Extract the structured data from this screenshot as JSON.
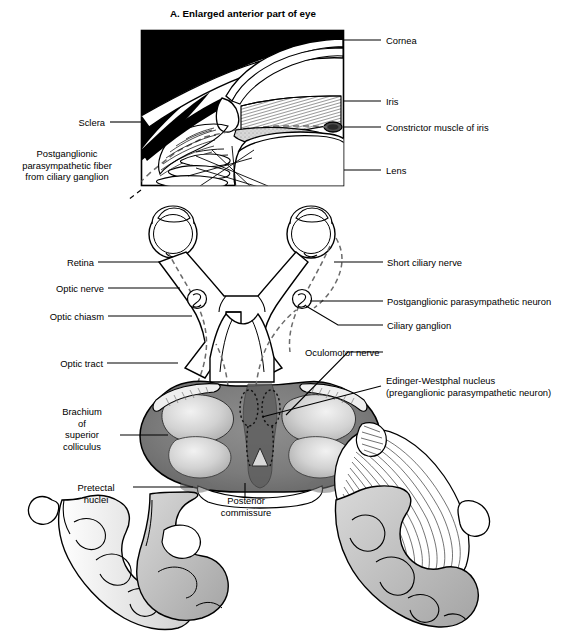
{
  "figure": {
    "panel_a": {
      "title": "A. Enlarged anterior part of eye",
      "labels_right": [
        {
          "id": "cornea",
          "text": "Cornea"
        },
        {
          "id": "iris",
          "text": "Iris"
        },
        {
          "id": "constrictor-muscle-of-iris",
          "text": "Constrictor muscle of iris"
        },
        {
          "id": "lens",
          "text": "Lens"
        }
      ],
      "labels_left": [
        {
          "id": "sclera",
          "text": "Sclera"
        },
        {
          "id": "postganglionic-parasympathetic-fiber",
          "text": "Postganglionic\nparasympathetic fiber\nfrom ciliary ganglion"
        }
      ]
    },
    "panel_b": {
      "labels_left": [
        {
          "id": "retina",
          "text": "Retina"
        },
        {
          "id": "optic-nerve",
          "text": "Optic nerve"
        },
        {
          "id": "optic-chiasm",
          "text": "Optic chiasm"
        },
        {
          "id": "optic-tract",
          "text": "Optic tract"
        },
        {
          "id": "brachium-of-superior-colliculus",
          "text": "Brachium\nof\nsuperior\ncolliculus"
        },
        {
          "id": "pretectal-nuclei",
          "text": "Pretectal\nnuclei"
        }
      ],
      "labels_right": [
        {
          "id": "short-ciliary-nerve",
          "text": "Short ciliary nerve"
        },
        {
          "id": "postganglionic-parasympathetic-neuron",
          "text": "Postganglionic parasympathetic neuron"
        },
        {
          "id": "ciliary-ganglion",
          "text": "Ciliary ganglion"
        },
        {
          "id": "oculomotor-nerve",
          "text": "Oculomotor nerve"
        },
        {
          "id": "edinger-westphal-nucleus",
          "text": "Edinger-Westphal nucleus\n(preganglionic parasympathetic neuron)"
        }
      ],
      "labels_center": [
        {
          "id": "posterior-commissure",
          "text": "Posterior\ncommissure"
        }
      ]
    },
    "caption": "",
    "colors": {
      "ink": "#000000",
      "panel_fill_dark": "#000000",
      "tissue_light": "#e8e8e8",
      "tissue_mid": "#b8b8b8",
      "tissue_dark": "#8d8d8d",
      "tissue_darker": "#6a6a6a",
      "background": "#ffffff"
    }
  }
}
